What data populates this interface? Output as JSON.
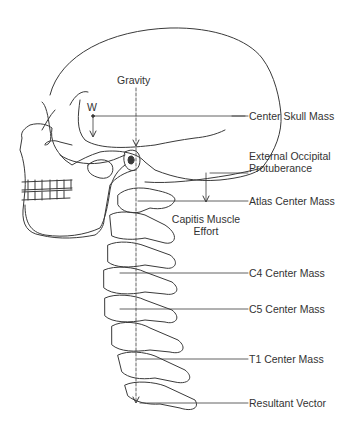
{
  "diagram": {
    "labels": {
      "gravity": "Gravity",
      "weight": "W",
      "center_skull_mass": "Center Skull Mass",
      "external_occipital_protuberance": [
        "External Occipital",
        "Protuberance"
      ],
      "atlas_center_mass": "Atlas Center Mass",
      "capitis_muscle_effort": [
        "Capitis Muscle",
        "Effort"
      ],
      "c4_center_mass": "C4 Center Mass",
      "c5_center_mass": "C5 Center Mass",
      "t1_center_mass": "T1 Center Mass",
      "resultant_vector": "Resultant Vector"
    },
    "colors": {
      "line": "#3a3a3a",
      "background": "#ffffff",
      "text": "#333333"
    }
  }
}
